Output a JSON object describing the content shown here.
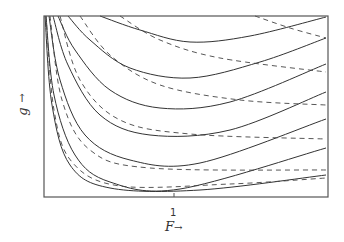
{
  "chart_data": {
    "type": "line",
    "title": "",
    "xlabel": "F →",
    "ylabel": "g →",
    "x_ticks": [
      {
        "value": 1,
        "label": "1"
      }
    ],
    "grid": false,
    "legend": null,
    "frame_px": {
      "left": 44,
      "top": 16,
      "right": 328,
      "bottom": 197
    },
    "series": [
      {
        "name": "solid-1",
        "style": "solid",
        "points": [
          [
            100,
            16
          ],
          [
            140,
            30
          ],
          [
            190,
            42
          ],
          [
            250,
            36
          ],
          [
            326,
            17
          ]
        ]
      },
      {
        "name": "solid-2",
        "style": "solid",
        "points": [
          [
            68,
            16
          ],
          [
            90,
            40
          ],
          [
            130,
            68
          ],
          [
            190,
            78
          ],
          [
            260,
            62
          ],
          [
            326,
            38
          ]
        ]
      },
      {
        "name": "solid-3",
        "style": "solid",
        "points": [
          [
            58,
            16
          ],
          [
            75,
            50
          ],
          [
            110,
            90
          ],
          [
            160,
            108
          ],
          [
            230,
            102
          ],
          [
            326,
            64
          ]
        ]
      },
      {
        "name": "solid-4",
        "style": "solid",
        "points": [
          [
            53,
            16
          ],
          [
            68,
            65
          ],
          [
            100,
            115
          ],
          [
            150,
            135
          ],
          [
            230,
            130
          ],
          [
            326,
            92
          ]
        ]
      },
      {
        "name": "solid-5",
        "style": "solid",
        "points": [
          [
            49,
            16
          ],
          [
            60,
            80
          ],
          [
            85,
            135
          ],
          [
            130,
            160
          ],
          [
            200,
            163
          ],
          [
            326,
            119
          ]
        ]
      },
      {
        "name": "solid-6",
        "style": "solid",
        "points": [
          [
            46,
            16
          ],
          [
            54,
            95
          ],
          [
            75,
            155
          ],
          [
            110,
            182
          ],
          [
            180,
            189
          ],
          [
            326,
            148
          ]
        ]
      },
      {
        "name": "solid-7",
        "style": "solid",
        "points": [
          [
            45,
            16
          ],
          [
            52,
            105
          ],
          [
            70,
            165
          ],
          [
            110,
            188
          ],
          [
            200,
            190
          ],
          [
            326,
            175
          ]
        ]
      },
      {
        "name": "dashed-1",
        "style": "dashed",
        "points": [
          [
            255,
            16
          ],
          [
            290,
            28
          ],
          [
            326,
            38
          ]
        ]
      },
      {
        "name": "dashed-2",
        "style": "dashed",
        "points": [
          [
            120,
            16
          ],
          [
            160,
            40
          ],
          [
            220,
            58
          ],
          [
            326,
            72
          ]
        ]
      },
      {
        "name": "dashed-3",
        "style": "dashed",
        "points": [
          [
            80,
            16
          ],
          [
            110,
            55
          ],
          [
            160,
            85
          ],
          [
            240,
            100
          ],
          [
            326,
            105
          ]
        ]
      },
      {
        "name": "dashed-4",
        "style": "dashed",
        "points": [
          [
            60,
            16
          ],
          [
            80,
            80
          ],
          [
            120,
            120
          ],
          [
            190,
            134
          ],
          [
            326,
            139
          ]
        ]
      },
      {
        "name": "dashed-5",
        "style": "dashed",
        "points": [
          [
            50,
            16
          ],
          [
            62,
            100
          ],
          [
            90,
            150
          ],
          [
            150,
            168
          ],
          [
            326,
            170
          ]
        ]
      },
      {
        "name": "dashed-6",
        "style": "dashed",
        "points": [
          [
            46,
            16
          ],
          [
            54,
            110
          ],
          [
            72,
            162
          ],
          [
            120,
            186
          ],
          [
            230,
            184
          ],
          [
            326,
            178
          ]
        ]
      }
    ]
  },
  "axes": {
    "x_label": "F",
    "x_arrow": "→",
    "y_label": "g",
    "y_arrow": "↑",
    "x_tick_label": "1"
  }
}
